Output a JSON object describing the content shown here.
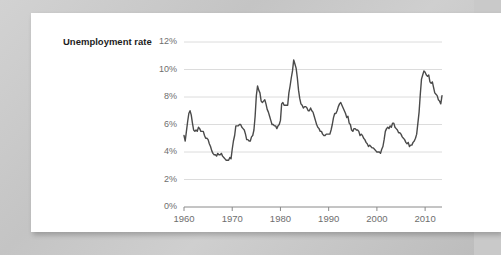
{
  "card": {
    "background_color": "#ffffff"
  },
  "page": {
    "background_color": "#c9c9c9"
  },
  "chart_data": {
    "type": "line",
    "title": "Unemployment rate",
    "xlabel": "",
    "ylabel": "Unemployment rate",
    "grid": true,
    "legend": "none",
    "line_color": "#4a4a4a",
    "grid_color": "#dcdcdc",
    "axis_color": "#8a8a8a",
    "tick_label_color": "#6e6e6e",
    "xlim": [
      1960,
      2013.5
    ],
    "ylim": [
      0,
      12
    ],
    "ytick_labels": [
      "0%",
      "2%",
      "4%",
      "6%",
      "8%",
      "10%",
      "12%"
    ],
    "ytick_values": [
      0,
      2,
      4,
      6,
      8,
      10,
      12
    ],
    "xtick_labels": [
      "1960",
      "1970",
      "1980",
      "1990",
      "2000",
      "2010"
    ],
    "xtick_values": [
      1960,
      1970,
      1980,
      1990,
      2000,
      2010
    ],
    "series": [
      {
        "name": "Unemployment rate",
        "x": [
          1960.0,
          1960.25,
          1960.5,
          1960.75,
          1961.0,
          1961.25,
          1961.5,
          1961.75,
          1962.0,
          1962.25,
          1962.5,
          1962.75,
          1963.0,
          1963.25,
          1963.5,
          1963.75,
          1964.0,
          1964.25,
          1964.5,
          1964.75,
          1965.0,
          1965.25,
          1965.5,
          1965.75,
          1966.0,
          1966.25,
          1966.5,
          1966.75,
          1967.0,
          1967.25,
          1967.5,
          1967.75,
          1968.0,
          1968.25,
          1968.5,
          1968.75,
          1969.0,
          1969.25,
          1969.5,
          1969.75,
          1970.0,
          1970.25,
          1970.5,
          1970.75,
          1971.0,
          1971.25,
          1971.5,
          1971.75,
          1972.0,
          1972.25,
          1972.5,
          1972.75,
          1973.0,
          1973.25,
          1973.5,
          1973.75,
          1974.0,
          1974.25,
          1974.5,
          1974.75,
          1975.0,
          1975.25,
          1975.5,
          1975.75,
          1976.0,
          1976.25,
          1976.5,
          1976.75,
          1977.0,
          1977.25,
          1977.5,
          1977.75,
          1978.0,
          1978.25,
          1978.5,
          1978.75,
          1979.0,
          1979.25,
          1979.5,
          1979.75,
          1980.0,
          1980.25,
          1980.5,
          1980.75,
          1981.0,
          1981.25,
          1981.5,
          1981.75,
          1982.0,
          1982.25,
          1982.5,
          1982.75,
          1983.0,
          1983.25,
          1983.5,
          1983.75,
          1984.0,
          1984.25,
          1984.5,
          1984.75,
          1985.0,
          1985.25,
          1985.5,
          1985.75,
          1986.0,
          1986.25,
          1986.5,
          1986.75,
          1987.0,
          1987.25,
          1987.5,
          1987.75,
          1988.0,
          1988.25,
          1988.5,
          1988.75,
          1989.0,
          1989.25,
          1989.5,
          1989.75,
          1990.0,
          1990.25,
          1990.5,
          1990.75,
          1991.0,
          1991.25,
          1991.5,
          1991.75,
          1992.0,
          1992.25,
          1992.5,
          1992.75,
          1993.0,
          1993.25,
          1993.5,
          1993.75,
          1994.0,
          1994.25,
          1994.5,
          1994.75,
          1995.0,
          1995.25,
          1995.5,
          1995.75,
          1996.0,
          1996.25,
          1996.5,
          1996.75,
          1997.0,
          1997.25,
          1997.5,
          1997.75,
          1998.0,
          1998.25,
          1998.5,
          1998.75,
          1999.0,
          1999.25,
          1999.5,
          1999.75,
          2000.0,
          2000.25,
          2000.5,
          2000.75,
          2001.0,
          2001.25,
          2001.5,
          2001.75,
          2002.0,
          2002.25,
          2002.5,
          2002.75,
          2003.0,
          2003.25,
          2003.5,
          2003.75,
          2004.0,
          2004.25,
          2004.5,
          2004.75,
          2005.0,
          2005.25,
          2005.5,
          2005.75,
          2006.0,
          2006.25,
          2006.5,
          2006.75,
          2007.0,
          2007.25,
          2007.5,
          2007.75,
          2008.0,
          2008.25,
          2008.5,
          2008.75,
          2009.0,
          2009.25,
          2009.5,
          2009.75,
          2010.0,
          2010.25,
          2010.5,
          2010.75,
          2011.0,
          2011.25,
          2011.5,
          2011.75,
          2012.0,
          2012.25,
          2012.5,
          2012.75,
          2013.0,
          2013.25,
          2013.5
        ],
        "values": [
          5.2,
          4.8,
          5.5,
          6.2,
          6.8,
          7.0,
          6.7,
          6.1,
          5.6,
          5.5,
          5.6,
          5.5,
          5.8,
          5.7,
          5.5,
          5.5,
          5.5,
          5.2,
          5.0,
          5.0,
          4.9,
          4.6,
          4.4,
          4.1,
          3.9,
          3.8,
          3.8,
          3.7,
          3.9,
          3.8,
          3.8,
          3.9,
          3.7,
          3.6,
          3.5,
          3.4,
          3.4,
          3.4,
          3.6,
          3.5,
          4.2,
          4.8,
          5.2,
          5.9,
          5.9,
          5.9,
          6.0,
          6.0,
          5.8,
          5.7,
          5.6,
          5.3,
          4.9,
          4.9,
          4.8,
          4.8,
          5.1,
          5.2,
          5.6,
          6.6,
          8.1,
          8.8,
          8.5,
          8.3,
          7.7,
          7.6,
          7.7,
          7.8,
          7.5,
          7.1,
          6.9,
          6.6,
          6.3,
          6.0,
          6.0,
          5.9,
          5.9,
          5.7,
          5.9,
          6.0,
          6.3,
          7.5,
          7.6,
          7.4,
          7.4,
          7.4,
          7.4,
          8.3,
          8.8,
          9.4,
          9.9,
          10.7,
          10.4,
          10.1,
          9.4,
          8.5,
          7.9,
          7.5,
          7.4,
          7.2,
          7.3,
          7.3,
          7.2,
          7.0,
          7.0,
          7.2,
          7.0,
          6.9,
          6.6,
          6.3,
          6.0,
          5.8,
          5.7,
          5.5,
          5.5,
          5.3,
          5.2,
          5.2,
          5.3,
          5.3,
          5.3,
          5.3,
          5.6,
          6.0,
          6.5,
          6.8,
          6.8,
          7.0,
          7.3,
          7.5,
          7.6,
          7.4,
          7.2,
          7.0,
          6.8,
          6.5,
          6.6,
          6.1,
          6.0,
          5.6,
          5.5,
          5.7,
          5.7,
          5.6,
          5.6,
          5.5,
          5.2,
          5.3,
          5.2,
          5.0,
          4.9,
          4.7,
          4.6,
          4.4,
          4.5,
          4.4,
          4.3,
          4.3,
          4.2,
          4.1,
          4.0,
          4.0,
          4.0,
          3.9,
          4.2,
          4.4,
          4.9,
          5.5,
          5.7,
          5.8,
          5.7,
          5.9,
          5.8,
          6.1,
          6.1,
          5.8,
          5.7,
          5.6,
          5.4,
          5.4,
          5.3,
          5.1,
          5.0,
          4.9,
          4.7,
          4.6,
          4.7,
          4.4,
          4.5,
          4.5,
          4.7,
          4.8,
          5.0,
          5.3,
          6.1,
          6.9,
          8.2,
          9.3,
          9.6,
          9.9,
          9.8,
          9.6,
          9.5,
          9.6,
          9.1,
          9.0,
          9.1,
          8.7,
          8.3,
          8.2,
          8.1,
          7.8,
          7.7,
          7.5,
          8.1
        ]
      }
    ]
  }
}
